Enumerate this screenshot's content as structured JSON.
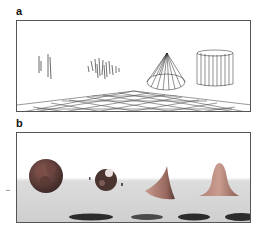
{
  "figure": {
    "panels": [
      {
        "label": "a",
        "description": "Wireframe renderings of four objects above a perspective grid floor",
        "objects": [
          "sparse-vertical-strokes",
          "scribbled-sphere",
          "wireframe-cone",
          "wireframe-cylinder"
        ],
        "style": "line-drawing",
        "background": "#ffffff"
      },
      {
        "label": "b",
        "description": "Shaded renderings of four objects above a gray floor with cast shadows",
        "objects": [
          "bumpy-sphere",
          "fragmented-sphere",
          "curved-cone",
          "bell-shaped-mound"
        ],
        "style": "shaded",
        "background": "#ffffff",
        "floor_color": "#d0d0d0"
      }
    ]
  }
}
